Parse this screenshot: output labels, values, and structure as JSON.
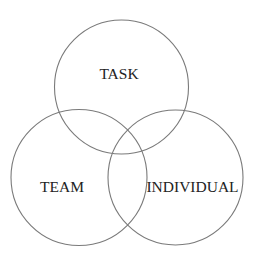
{
  "diagram": {
    "type": "venn",
    "stroke_color": "#7a7a7a",
    "text_color": "#222222",
    "background": "#ffffff",
    "circles": [
      {
        "id": "task",
        "label": "TASK",
        "cx": 121.5,
        "cy": 87,
        "r": 67,
        "label_x": 119,
        "label_y": 79
      },
      {
        "id": "team",
        "label": "TEAM",
        "cx": 79,
        "cy": 177.5,
        "r": 68,
        "label_x": 62,
        "label_y": 192
      },
      {
        "id": "individual",
        "label": "INDIVIDUAL",
        "cx": 175.5,
        "cy": 177.5,
        "r": 67.5,
        "label_x": 192.5,
        "label_y": 192
      }
    ]
  }
}
